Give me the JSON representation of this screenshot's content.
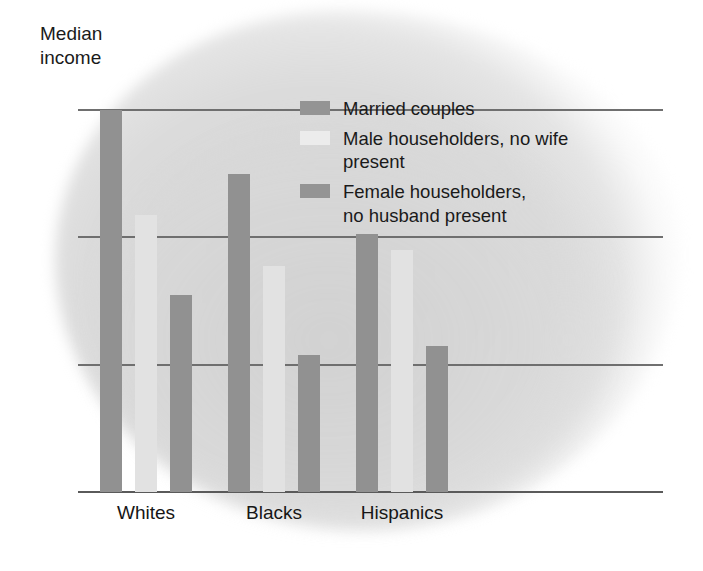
{
  "chart_data": {
    "type": "bar",
    "title": "",
    "ylabel": "Median\nincome",
    "xlabel": "",
    "categories": [
      "Whites",
      "Blacks",
      "Hispanics"
    ],
    "series": [
      {
        "name": "Married couples",
        "color": "#919191",
        "values": [
          60,
          50,
          40.5
        ]
      },
      {
        "name": "Male householders, no wife present",
        "color": "#e2e2e2",
        "values": [
          43.5,
          35.5,
          38
        ]
      },
      {
        "name": "Female householders,\nno husband present",
        "color": "#919191",
        "values": [
          31,
          21.5,
          23
        ]
      }
    ],
    "ylim": [
      0,
      60
    ],
    "yticks": [
      0,
      20,
      40,
      60
    ],
    "ytick_labels": [
      "0",
      "20",
      "40",
      "60"
    ],
    "grid": true,
    "legend_position": "top-center"
  },
  "axis": {
    "title": "Median\nincome",
    "ticks": [
      {
        "label": "60",
        "value": 60
      },
      {
        "label": "40",
        "value": 40
      },
      {
        "label": "20",
        "value": 20
      },
      {
        "label": "0",
        "value": 0
      }
    ],
    "categories": [
      {
        "label": "Whites"
      },
      {
        "label": "Blacks"
      },
      {
        "label": "Hispanics"
      }
    ]
  },
  "legend": {
    "items": [
      {
        "label": "Married couples",
        "swatch": "dark"
      },
      {
        "label": "Male householders, no wife present",
        "swatch": "light"
      },
      {
        "label": "Female householders,\nno husband present",
        "swatch": "dark"
      }
    ]
  }
}
